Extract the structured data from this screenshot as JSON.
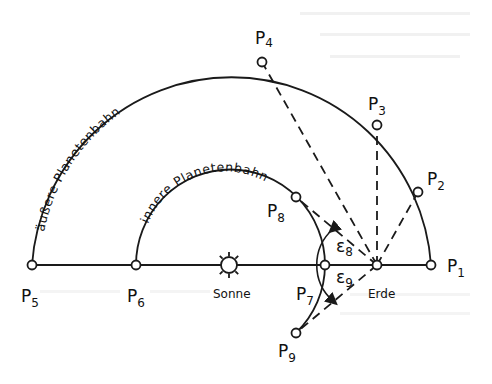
{
  "figure": {
    "orbit_labels": {
      "outer": "äußere Planetenbahn",
      "inner": "innere Planetenbahn"
    },
    "bodies": {
      "sun": "Sonne",
      "earth": "Erde"
    },
    "points": {
      "p1": {
        "base": "P",
        "sub": "1"
      },
      "p2": {
        "base": "P",
        "sub": "2"
      },
      "p3": {
        "base": "P",
        "sub": "3"
      },
      "p4": {
        "base": "P",
        "sub": "4"
      },
      "p5": {
        "base": "P",
        "sub": "5"
      },
      "p6": {
        "base": "P",
        "sub": "6"
      },
      "p7": {
        "base": "P",
        "sub": "7"
      },
      "p8": {
        "base": "P",
        "sub": "8"
      },
      "p9": {
        "base": "P",
        "sub": "9"
      }
    },
    "angles": {
      "e8": {
        "base": "ε",
        "sub": "8"
      },
      "e9": {
        "base": "ε",
        "sub": "9"
      }
    },
    "colors": {
      "ink": "#1a1a1a",
      "paper": "#ffffff",
      "bleed_through": "#d9d9d9"
    }
  }
}
